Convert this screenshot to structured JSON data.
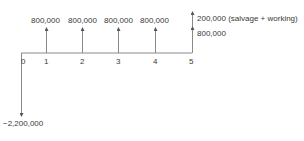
{
  "diagram": {
    "type": "cash-flow-diagram",
    "periods": [
      "0",
      "1",
      "2",
      "3",
      "4",
      "5"
    ],
    "inflows": [
      {
        "period": "1",
        "label": "800,000"
      },
      {
        "period": "2",
        "label": "800,000"
      },
      {
        "period": "3",
        "label": "800,000"
      },
      {
        "period": "4",
        "label": "800,000"
      },
      {
        "period": "5",
        "label": "800,000"
      },
      {
        "period": "5",
        "label": "200,000 (salvage + working)"
      }
    ],
    "outflows": [
      {
        "period": "0",
        "label": "−2,200,000"
      }
    ],
    "colors": {
      "line": "#7a7a7a",
      "text": "#3a3a3a",
      "background": "#ffffff"
    }
  }
}
